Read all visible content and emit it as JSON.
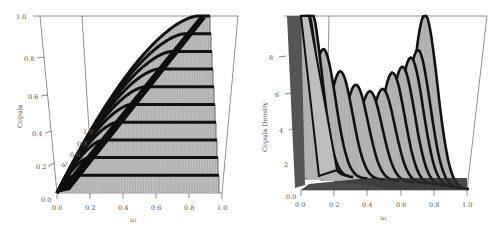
{
  "chart_data": [
    {
      "type": "surface-ribbon",
      "title": "",
      "xlabel": "u1",
      "ylabel": "Copula",
      "depth_axis_label": "u2",
      "x_ticks": [
        "0.0",
        "0.2",
        "0.4",
        "0.6",
        "0.8",
        "1.0"
      ],
      "y_ticks": [
        "0.0",
        "0.2",
        "0.4",
        "0.6",
        "0.8",
        "1.0"
      ],
      "depth_ticks": [
        "0.0",
        "0.2",
        "0.4",
        "0.6",
        "0.8",
        "1.0"
      ],
      "zlim": [
        0,
        1
      ],
      "grid": false,
      "ribbons": [
        {
          "u2": 0.1,
          "plateau": 0.1
        },
        {
          "u2": 0.2,
          "plateau": 0.2
        },
        {
          "u2": 0.3,
          "plateau": 0.3
        },
        {
          "u2": 0.4,
          "plateau": 0.4
        },
        {
          "u2": 0.5,
          "plateau": 0.5
        },
        {
          "u2": 0.6,
          "plateau": 0.6
        },
        {
          "u2": 0.7,
          "plateau": 0.7
        },
        {
          "u2": 0.8,
          "plateau": 0.8
        },
        {
          "u2": 0.9,
          "plateau": 0.9
        },
        {
          "u2": 1.0,
          "plateau": 1.0
        }
      ]
    },
    {
      "type": "surface-ribbon",
      "title": "",
      "xlabel": "u1",
      "ylabel": "Copula Density",
      "depth_axis_label": "u2",
      "x_ticks": [
        "0.0",
        "0.2",
        "0.4",
        "0.6",
        "0.8",
        "1.0"
      ],
      "y_ticks": [
        "0",
        "2",
        "4",
        "6",
        "8"
      ],
      "zlim": [
        0,
        10
      ],
      "grid": false,
      "ribbons": [
        {
          "u2": 0.02,
          "peak_u1": 0.0,
          "peak": 10.0
        },
        {
          "u2": 0.05,
          "peak_u1": 0.03,
          "peak": 10.0
        },
        {
          "u2": 0.13,
          "peak_u1": 0.13,
          "peak": 7.4
        },
        {
          "u2": 0.25,
          "peak_u1": 0.25,
          "peak": 6.2
        },
        {
          "u2": 0.36,
          "peak_u1": 0.36,
          "peak": 5.5
        },
        {
          "u2": 0.46,
          "peak_u1": 0.46,
          "peak": 5.2
        },
        {
          "u2": 0.55,
          "peak_u1": 0.55,
          "peak": 5.4
        },
        {
          "u2": 0.62,
          "peak_u1": 0.62,
          "peak": 6.4
        },
        {
          "u2": 0.69,
          "peak_u1": 0.69,
          "peak": 6.8
        },
        {
          "u2": 0.75,
          "peak_u1": 0.75,
          "peak": 7.4
        },
        {
          "u2": 0.8,
          "peak_u1": 0.8,
          "peak": 7.9
        },
        {
          "u2": 0.85,
          "peak_u1": 0.85,
          "peak": 10.0
        }
      ]
    }
  ],
  "labels": {
    "left": {
      "ylabel": "Copula",
      "xlabel": "u₁",
      "origin": "0.0",
      "y_ticks": [
        "0.2",
        "0.4",
        "0.6",
        "0.8",
        "1.0"
      ],
      "x_ticks": [
        "0.0",
        "0.2",
        "0.4",
        "0.6",
        "0.8",
        "1.0"
      ],
      "depth_ticks": [
        "0.2",
        "0.4",
        "0.6",
        "0.8",
        "1.0"
      ],
      "depth_label": "u₂"
    },
    "right": {
      "ylabel": "Copula Density",
      "xlabel": "u₁",
      "origin": "0.0",
      "y_ticks": [
        "2",
        "4",
        "6",
        "8"
      ],
      "x_ticks": [
        "0.0",
        "0.2",
        "0.4",
        "0.6",
        "0.8",
        "1.0"
      ]
    }
  },
  "colors": {
    "surface_fill": "#bdbdbd",
    "ribbon_edge": "#111111",
    "axis": "#444444",
    "text": "#555555"
  }
}
